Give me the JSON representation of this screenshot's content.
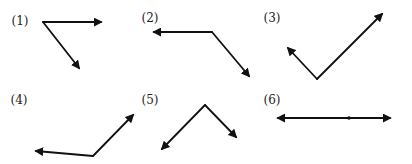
{
  "figure": {
    "width": 412,
    "height": 164,
    "stroke_color": "#111111",
    "label_color": "#222222",
    "panels": [
      {
        "label": "(1)",
        "label_pos": [
          20,
          25
        ],
        "vertex": [
          43,
          22
        ],
        "rays": [
          [
            101,
            22
          ],
          [
            79,
            68
          ]
        ],
        "description": "vertex with one ray pointing right and one ray pointing down-right (acute angle)"
      },
      {
        "label": "(2)",
        "label_pos": [
          150,
          22
        ],
        "vertex": [
          212,
          32
        ],
        "rays": [
          [
            154,
            32
          ],
          [
            249,
            76
          ]
        ],
        "description": "vertex with one ray pointing left and one ray pointing down-right (obtuse angle)"
      },
      {
        "label": "(3)",
        "label_pos": [
          272,
          22
        ],
        "vertex": [
          317,
          79
        ],
        "rays": [
          [
            288,
            48
          ],
          [
            382,
            14
          ]
        ],
        "description": "vertex at bottom with rays pointing up-left and up-right (right angle)"
      },
      {
        "label": "(4)",
        "label_pos": [
          19,
          104
        ],
        "vertex": [
          93,
          156
        ],
        "rays": [
          [
            36,
            151
          ],
          [
            133,
            115
          ]
        ],
        "description": "vertex at bottom with rays pointing left and up-right (obtuse angle)"
      },
      {
        "label": "(5)",
        "label_pos": [
          150,
          104
        ],
        "vertex": [
          205,
          105
        ],
        "rays": [
          [
            162,
            149
          ],
          [
            236,
            137
          ]
        ],
        "description": "vertex at top with rays pointing down-left and down-right (right angle)"
      },
      {
        "label": "(6)",
        "label_pos": [
          272,
          104
        ],
        "vertex": [
          349,
          118
        ],
        "rays": [
          [
            278,
            118
          ],
          [
            390,
            118
          ]
        ],
        "description": "vertex on a straight line with rays pointing left and right (straight angle)"
      }
    ]
  }
}
